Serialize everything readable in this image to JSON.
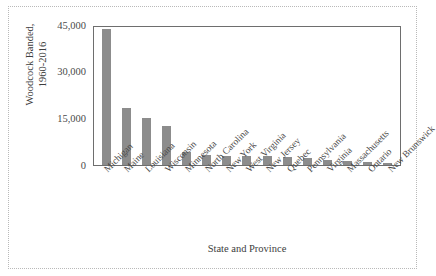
{
  "chart_data": {
    "type": "bar",
    "title": "",
    "xlabel": "State and Province",
    "ylabel": "Woodcock Banded, 1960-2016",
    "ylabel_lines": [
      "Woodcock Banded,",
      "1960-2016"
    ],
    "categories": [
      "Michigan",
      "Maine",
      "Louisiana",
      "Wisconsin",
      "Minnesota",
      "North Carolina",
      "New York",
      "West Virginia",
      "New Jersey",
      "Quebec",
      "Pennsylvania",
      "Virginia",
      "Massachusetts",
      "Ontario",
      "New Brunswick"
    ],
    "values": [
      43800,
      18300,
      15200,
      12400,
      4300,
      3100,
      3000,
      2900,
      2800,
      2700,
      2300,
      1700,
      1200,
      900,
      800
    ],
    "ylim": [
      0,
      45000
    ],
    "yticks": [
      0,
      15000,
      30000,
      45000
    ],
    "ytick_labels": [
      "0",
      "15,000",
      "30,000",
      "45,000"
    ],
    "grid": false,
    "legend": false,
    "bar_color": "#8c8c8c",
    "frame_color": "#6e6e6e",
    "figure_border": "#b9b9b9"
  }
}
